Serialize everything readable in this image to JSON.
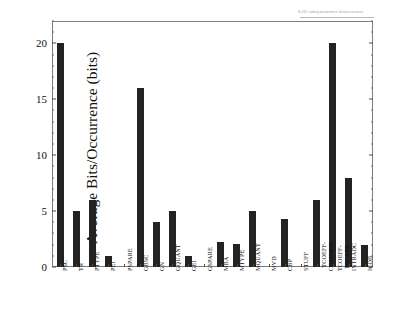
{
  "header": {
    "note": "H.261 coding parameters: bits/occurrence"
  },
  "chart_data": {
    "type": "bar",
    "title": "",
    "xlabel": "",
    "ylabel": "Average Bits/Occurrence (bits)",
    "ylim": [
      0,
      22
    ],
    "yticks": [
      0,
      5,
      10,
      15,
      20
    ],
    "ytick_labels": [
      "0",
      "5",
      "10",
      "15",
      "20"
    ],
    "grid": false,
    "legend": null,
    "categories": [
      "PSC",
      "TR",
      "PTYPE",
      "PEI",
      "PSPARE",
      "GBSC",
      "GN",
      "GQUANT",
      "GEI",
      "GSPARE",
      "MBA",
      "MTYPE",
      "MQUANT",
      "MVD",
      "CBP",
      "STUFF",
      "TCOEFF-COMMON",
      "TCOEFF-ESCAPE",
      "INTRADC",
      "ICOB"
    ],
    "category_lines": [
      [
        "PSC"
      ],
      [
        "TR"
      ],
      [
        "PTYPE"
      ],
      [
        "PEI"
      ],
      [
        "PSPARE"
      ],
      [
        "GBSC"
      ],
      [
        "GN"
      ],
      [
        "GQUANT"
      ],
      [
        "GEI"
      ],
      [
        "GSPARE"
      ],
      [
        "MBA"
      ],
      [
        "MTYPE"
      ],
      [
        "MQUANT"
      ],
      [
        "MVD"
      ],
      [
        "CBP"
      ],
      [
        "STUFF"
      ],
      [
        "TCOEFF-",
        "COMMON"
      ],
      [
        "TCOEFF-",
        "ESCAPE"
      ],
      [
        "INTRADC"
      ],
      [
        "ICOB"
      ]
    ],
    "values": [
      20,
      5,
      6,
      1,
      0,
      16,
      4,
      5,
      1,
      0,
      2.2,
      2.1,
      5,
      0,
      4.3,
      0,
      6,
      20,
      8,
      2
    ],
    "bar_color": "#232323"
  }
}
